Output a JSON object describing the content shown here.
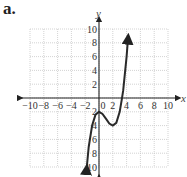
{
  "figure_label": "a.",
  "chart_data": {
    "type": "line",
    "title": "",
    "xlabel": "x",
    "ylabel": "y",
    "xlim": [
      -10,
      10
    ],
    "ylim": [
      -10,
      10
    ],
    "grid": true,
    "legend": null,
    "x_ticks": [
      -10,
      -8,
      -6,
      -4,
      -2,
      0,
      2,
      4,
      6,
      8,
      10
    ],
    "y_ticks": [
      -10,
      -8,
      -6,
      -4,
      -2,
      2,
      4,
      6,
      8,
      10
    ],
    "x_tick_labels": [
      "−10",
      "−8",
      "−6",
      "−4",
      "−2",
      "0",
      "2",
      "4",
      "6",
      "8",
      "10"
    ],
    "y_tick_labels": [
      "10",
      "8",
      "6",
      "4",
      "2",
      "2",
      "4",
      "6",
      "8",
      "10"
    ],
    "series": [
      {
        "name": "f(x)",
        "description": "cubic curve with arrows at both ends; local max at (0,-2), local min at (2,-4)",
        "x": [
          -1.8,
          -1.5,
          -1,
          -0.5,
          0,
          0.5,
          1,
          1.5,
          2,
          2.5,
          3,
          3.3,
          3.5,
          4,
          4.2
        ],
        "y": [
          -10.3,
          -7.1,
          -4.0,
          -2.4,
          -2.0,
          -2.3,
          -3.0,
          -3.7,
          -4.0,
          -3.6,
          -2.0,
          -0.2,
          1.1,
          6.0,
          8.6
        ]
      }
    ],
    "annotations": [
      "arrow at top end of curve near (4.2, 10)",
      "arrow at bottom end of curve near (-1.8, -10)"
    ]
  }
}
